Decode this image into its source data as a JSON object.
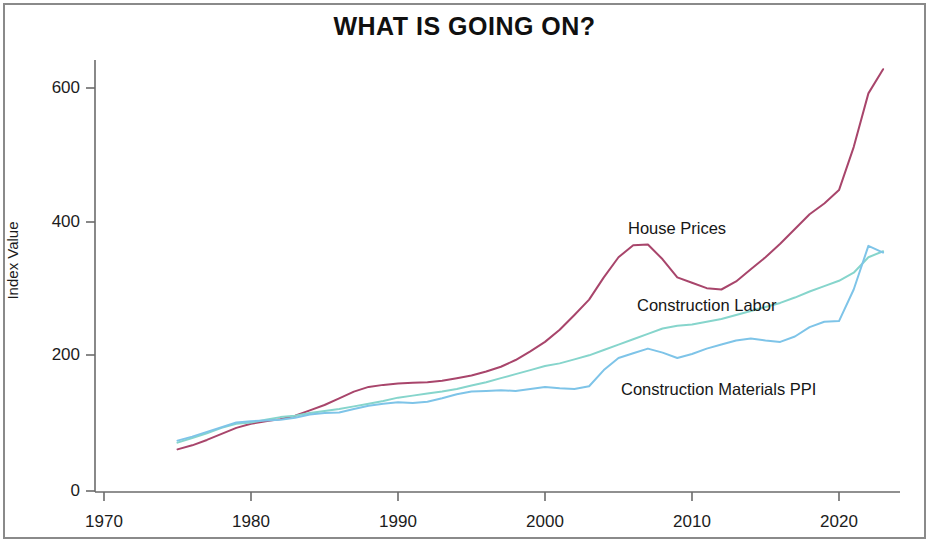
{
  "chart_data": {
    "type": "line",
    "title": "WHAT IS GOING ON?",
    "xlabel": "",
    "ylabel": "Index Value",
    "xlim": [
      1968,
      2025
    ],
    "ylim": [
      0,
      660
    ],
    "xticks": [
      "1970",
      "1980",
      "1990",
      "2000",
      "2010",
      "2020"
    ],
    "xtick_values": [
      1970,
      1980,
      1990,
      2000,
      2010,
      2020
    ],
    "yticks": [
      "0",
      "200",
      "400",
      "600"
    ],
    "ytick_values": [
      0,
      200,
      400,
      600
    ],
    "grid": false,
    "legend_position": "inline-annotations",
    "x": [
      1975,
      1976,
      1977,
      1978,
      1979,
      1980,
      1981,
      1982,
      1983,
      1984,
      1985,
      1986,
      1987,
      1988,
      1989,
      1990,
      1991,
      1992,
      1993,
      1994,
      1995,
      1996,
      1997,
      1998,
      1999,
      2000,
      2001,
      2002,
      2003,
      2004,
      2005,
      2006,
      2007,
      2008,
      2009,
      2010,
      2011,
      2012,
      2013,
      2014,
      2015,
      2016,
      2017,
      2018,
      2019,
      2020,
      2021,
      2022,
      2023
    ],
    "series": [
      {
        "name": "House Prices",
        "color": "#a8456b",
        "values": [
          62,
          68,
          76,
          85,
          94,
          100,
          104,
          107,
          112,
          120,
          128,
          138,
          148,
          155,
          158,
          160,
          161,
          162,
          164,
          168,
          172,
          178,
          185,
          195,
          208,
          222,
          240,
          262,
          285,
          318,
          348,
          366,
          367,
          345,
          318,
          310,
          302,
          300,
          312,
          330,
          348,
          368,
          390,
          412,
          428,
          448,
          512,
          592,
          628
        ]
      },
      {
        "name": "Construction Labor",
        "color": "#86d5cc",
        "values": [
          72,
          79,
          86,
          94,
          100,
          102,
          106,
          110,
          112,
          116,
          119,
          122,
          126,
          130,
          134,
          139,
          142,
          145,
          148,
          152,
          157,
          162,
          168,
          174,
          180,
          186,
          190,
          196,
          202,
          210,
          218,
          226,
          234,
          242,
          246,
          248,
          252,
          256,
          262,
          268,
          274,
          280,
          288,
          297,
          305,
          313,
          325,
          348,
          357
        ]
      },
      {
        "name": "Construction Materials PPI",
        "color": "#7ec4e8",
        "values": [
          75,
          81,
          88,
          95,
          102,
          104,
          105,
          106,
          109,
          114,
          116,
          117,
          122,
          127,
          130,
          132,
          131,
          133,
          138,
          144,
          148,
          149,
          150,
          149,
          152,
          155,
          153,
          152,
          156,
          180,
          198,
          205,
          212,
          206,
          198,
          204,
          212,
          218,
          224,
          227,
          224,
          222,
          230,
          244,
          252,
          253,
          300,
          365,
          355
        ]
      }
    ],
    "annotations": [
      {
        "text": "House Prices",
        "x": 2005,
        "y": 400
      },
      {
        "text": "Construction Labor",
        "x": 2008,
        "y": 289
      },
      {
        "text": "Construction Materials PPI",
        "x": 2009,
        "y": 162
      }
    ]
  }
}
